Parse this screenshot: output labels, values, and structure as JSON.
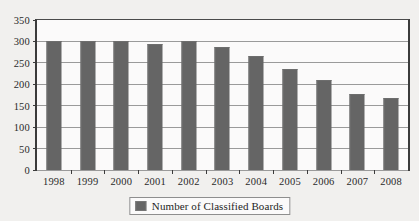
{
  "chart_data": {
    "type": "bar",
    "title": "",
    "xlabel": "",
    "ylabel": "",
    "categories": [
      "1998",
      "1999",
      "2000",
      "2001",
      "2002",
      "2003",
      "2004",
      "2005",
      "2006",
      "2007",
      "2008"
    ],
    "values": [
      300,
      300,
      300,
      294,
      300,
      288,
      265,
      235,
      209,
      178,
      169
    ],
    "series": [
      {
        "name": "Number of Classified Boards",
        "values": [
          300,
          300,
          300,
          294,
          300,
          288,
          265,
          235,
          209,
          178,
          169
        ]
      }
    ],
    "ylim": [
      0,
      350
    ],
    "yticks": [
      0,
      50,
      100,
      150,
      200,
      250,
      300,
      350
    ],
    "ytick_labels": [
      "0",
      "50",
      "100",
      "150",
      "200",
      "250",
      "300",
      "350"
    ],
    "grid": true,
    "legend_position": "bottom-center",
    "bar_color": "#656565",
    "plot_background": "#fbfafa",
    "page_background": "#f1f0ee",
    "axis_color": "#3b3b3b",
    "gridline_color": "#9a9a9a"
  },
  "legend": {
    "entries": [
      {
        "label": "Number of Classified Boards",
        "swatch_icon": "legend-swatch-square",
        "color": "#656565"
      }
    ]
  }
}
